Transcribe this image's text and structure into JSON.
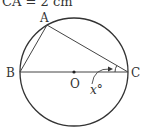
{
  "caption": "CA = 2 cm",
  "points": {
    "A": {
      "label": "A",
      "x": 47,
      "y": 25
    },
    "B": {
      "label": "B",
      "x": 20,
      "y": 72
    },
    "C": {
      "label": "C",
      "x": 128,
      "y": 72
    },
    "O": {
      "label": "O",
      "x": 74,
      "y": 72
    }
  },
  "circle": {
    "cx": 74,
    "cy": 72,
    "r": 54
  },
  "angle_label": "x°",
  "colors": {
    "stroke": "#333333",
    "background": "#ffffff"
  }
}
